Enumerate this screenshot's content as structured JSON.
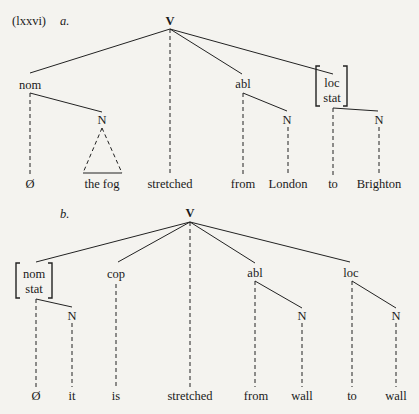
{
  "example_label": "(lxxvi)",
  "tree_a": {
    "label": "a.",
    "root": "V",
    "nodes": {
      "nom": "nom",
      "nom_n": "N",
      "abl": "abl",
      "abl_n": "N",
      "loc_line1": "loc",
      "loc_line2": "stat",
      "loc_n": "N"
    },
    "leaves": [
      "Ø",
      "the fog",
      "stretched",
      "from",
      "London",
      "to",
      "Brighton"
    ]
  },
  "tree_b": {
    "label": "b.",
    "root": "V",
    "nodes": {
      "nom_line1": "nom",
      "nom_line2": "stat",
      "nom_n": "N",
      "cop": "cop",
      "abl": "abl",
      "abl_n": "N",
      "loc": "loc",
      "loc_n": "N"
    },
    "leaves": [
      "Ø",
      "it",
      "is",
      "stretched",
      "from",
      "wall",
      "to",
      "wall"
    ]
  }
}
